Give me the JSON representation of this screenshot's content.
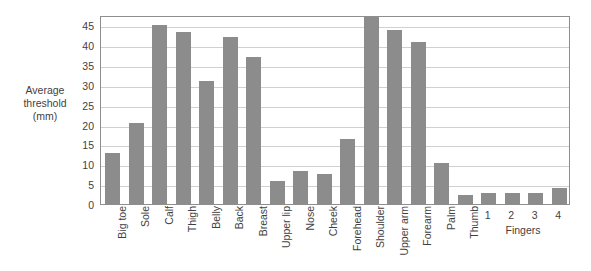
{
  "chart_data": {
    "type": "bar",
    "title": "",
    "xlabel": "",
    "ylabel": "Average threshold (mm)",
    "ylabel_lines": [
      "Average",
      "threshold",
      "(mm)"
    ],
    "ylim": [
      0,
      47.6
    ],
    "yticks": [
      0,
      5,
      10,
      15,
      20,
      25,
      30,
      35,
      40,
      45
    ],
    "ytick_labels": [
      "0",
      "5",
      "10",
      "15",
      "20",
      "25",
      "30",
      "35",
      "40",
      "45"
    ],
    "grid": true,
    "legend": null,
    "bar_color": "#8c8c8c",
    "categories": [
      "Big toe",
      "Sole",
      "Calf",
      "Thigh",
      "Belly",
      "Back",
      "Breast",
      "Upper lip",
      "Nose",
      "Cheek",
      "Forehead",
      "Shoulder",
      "Upper arm",
      "Forearm",
      "Palm",
      "Thumb",
      "1",
      "2",
      "3",
      "4"
    ],
    "values": [
      12.8,
      20.5,
      45.0,
      43.3,
      31.0,
      42.0,
      37.1,
      5.8,
      8.4,
      7.5,
      16.5,
      47.0,
      43.8,
      40.8,
      10.3,
      2.2,
      2.7,
      2.8,
      2.7,
      4.1
    ],
    "annotations": [
      {
        "text": "Fingers",
        "covers": [
          "1",
          "2",
          "3",
          "4"
        ]
      }
    ]
  },
  "axis": {
    "y_title_lines": [
      "Average",
      "threshold",
      "(mm)"
    ]
  }
}
